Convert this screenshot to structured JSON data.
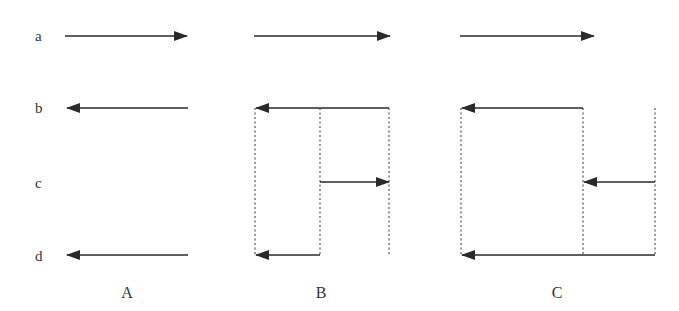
{
  "canvas": {
    "width": 679,
    "height": 311,
    "background": "#ffffff"
  },
  "colors": {
    "arrow": "#2a2a2a",
    "dotted": "#555555",
    "text": "#333333"
  },
  "row_labels": [
    {
      "text": "a",
      "x": 35,
      "y": 41
    },
    {
      "text": "b",
      "x": 35,
      "y": 113
    },
    {
      "text": "c",
      "x": 35,
      "y": 188
    },
    {
      "text": "d",
      "x": 35,
      "y": 261
    }
  ],
  "panels": [
    {
      "label": "A",
      "label_x": 127,
      "label_y": 298,
      "verticals": [],
      "arrows": [
        {
          "row": "a",
          "x1": 65,
          "x2": 187,
          "y": 36
        },
        {
          "row": "b",
          "x1": 188,
          "x2": 67,
          "y": 108
        },
        {
          "row": "d",
          "x1": 188,
          "x2": 67,
          "y": 255
        }
      ]
    },
    {
      "label": "B",
      "label_x": 321,
      "label_y": 298,
      "verticals": [
        {
          "x": 255,
          "y1": 108,
          "y2": 256
        },
        {
          "x": 320,
          "y1": 108,
          "y2": 256
        },
        {
          "x": 389,
          "y1": 108,
          "y2": 256
        }
      ],
      "arrows": [
        {
          "row": "a",
          "x1": 254,
          "x2": 390,
          "y": 36
        },
        {
          "row": "b",
          "x1": 389,
          "x2": 256,
          "y": 108
        },
        {
          "row": "c",
          "x1": 320,
          "x2": 389,
          "y": 182
        },
        {
          "row": "d",
          "x1": 320,
          "x2": 256,
          "y": 255
        }
      ]
    },
    {
      "label": "C",
      "label_x": 557,
      "label_y": 298,
      "verticals": [
        {
          "x": 461,
          "y1": 108,
          "y2": 256
        },
        {
          "x": 583,
          "y1": 108,
          "y2": 256
        },
        {
          "x": 655,
          "y1": 108,
          "y2": 256
        }
      ],
      "arrows": [
        {
          "row": "a",
          "x1": 460,
          "x2": 594,
          "y": 36
        },
        {
          "row": "b",
          "x1": 583,
          "x2": 462,
          "y": 108
        },
        {
          "row": "c",
          "x1": 655,
          "x2": 584,
          "y": 182
        },
        {
          "row": "d",
          "x1": 655,
          "x2": 462,
          "y": 255
        }
      ]
    }
  ]
}
